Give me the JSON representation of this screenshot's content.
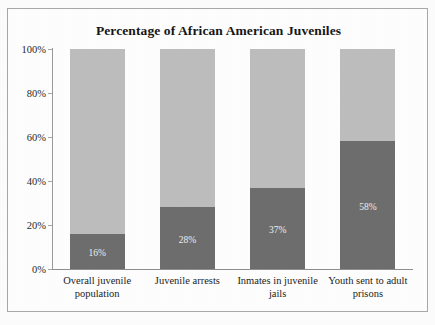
{
  "chart_data": {
    "type": "bar",
    "subtype": "stacked-100-percent",
    "title": "Percentage of African American Juveniles",
    "xlabel": "",
    "ylabel": "",
    "ylim": [
      0,
      100
    ],
    "ytick_labels": [
      "0%",
      "20%",
      "40%",
      "60%",
      "80%",
      "100%"
    ],
    "ytick_values": [
      0,
      20,
      40,
      60,
      80,
      100
    ],
    "grid": false,
    "legend": "none",
    "categories": [
      "Overall juvenile population",
      "Juvenile arrests",
      "Inmates in juvenile jails",
      "Youth sent to adult prisons"
    ],
    "series": [
      {
        "name": "African American",
        "color": "#6e6e6e",
        "values": [
          16,
          28,
          37,
          58
        ],
        "labels": [
          "16%",
          "28%",
          "37%",
          "58%"
        ]
      },
      {
        "name": "Remainder",
        "color": "#bebebe",
        "values": [
          84,
          72,
          63,
          42
        ],
        "labels": [
          "",
          "",
          "",
          ""
        ]
      }
    ]
  },
  "colors": {
    "dark_segment": "#6e6e6e",
    "light_segment": "#bebebe",
    "frame_border": "#a9a9a9",
    "axis_line": "#9a9a9a",
    "background": "#ffffff",
    "title_text": "#161616",
    "value_label_text": "#efefef"
  }
}
